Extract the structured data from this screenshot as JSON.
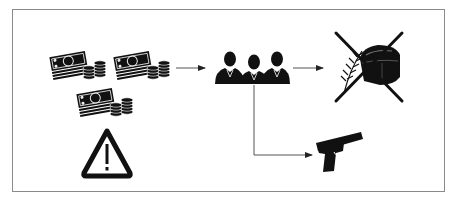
{
  "diagram": {
    "type": "flow",
    "colors": {
      "icon": "#111111",
      "connector": "#555555",
      "frame": "#8a8a8a",
      "background": "#ffffff"
    },
    "nodes": [
      {
        "id": "money-1",
        "icon": "money-bundle-icon",
        "label": "Money"
      },
      {
        "id": "money-2",
        "icon": "money-bundle-icon",
        "label": "Money"
      },
      {
        "id": "money-3",
        "icon": "money-bundle-icon",
        "label": "Money"
      },
      {
        "id": "warning",
        "icon": "warning-icon",
        "label": "Warning"
      },
      {
        "id": "people",
        "icon": "businessmen-group-icon",
        "label": "Group of people"
      },
      {
        "id": "food-crossed",
        "icon": "bread-wheat-crossed-icon",
        "label": "Food (crossed out)"
      },
      {
        "id": "gun",
        "icon": "pistol-icon",
        "label": "Gun"
      }
    ],
    "edges": [
      {
        "from": "money-2",
        "to": "people",
        "style": "arrow"
      },
      {
        "from": "people",
        "to": "food-crossed",
        "style": "arrow"
      },
      {
        "from": "people",
        "to": "gun",
        "style": "elbow-arrow"
      }
    ]
  }
}
